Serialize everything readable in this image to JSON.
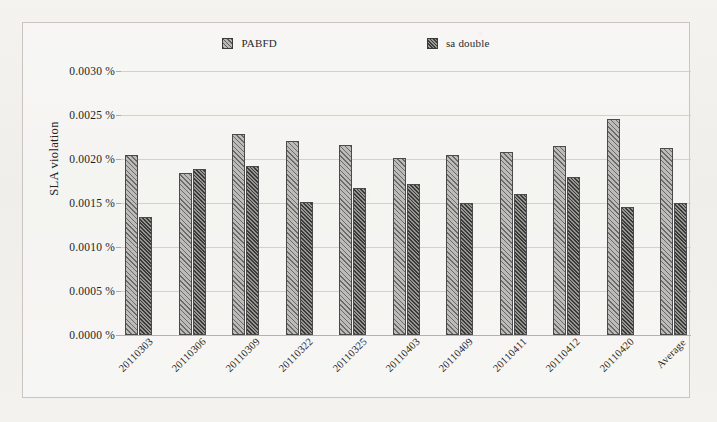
{
  "chart_data": {
    "type": "bar",
    "title": "",
    "xlabel": "",
    "ylabel": "SLA violation",
    "ylim": [
      0.0,
      0.003
    ],
    "grid": true,
    "legend_position": "top",
    "categories": [
      "20110303",
      "20110306",
      "20110309",
      "20110322",
      "20110325",
      "20110403",
      "20110409",
      "20110411",
      "20110412",
      "20110420",
      "Average"
    ],
    "ytick_labels": [
      "0.0030 %",
      "0.0025 %",
      "0.0020 %",
      "0.0015 %",
      "0.0010 %",
      "0.0005 %",
      "0.0000 %"
    ],
    "ytick_values": [
      0.003,
      0.0025,
      0.002,
      0.0015,
      0.001,
      0.0005,
      0.0
    ],
    "series": [
      {
        "name": "PABFD",
        "pattern": "diagonal-hatch-light",
        "values": [
          0.00205,
          0.00184,
          0.00228,
          0.0022,
          0.00216,
          0.00201,
          0.00205,
          0.00208,
          0.00215,
          0.00245,
          0.00213
        ]
      },
      {
        "name": "sa double",
        "pattern": "diagonal-hatch-dark",
        "values": [
          0.00134,
          0.00189,
          0.00192,
          0.00151,
          0.00167,
          0.00172,
          0.0015,
          0.0016,
          0.0018,
          0.00146,
          0.0015
        ]
      }
    ]
  },
  "legend": {
    "entries": [
      {
        "label": "PABFD",
        "swatch": "legend-swatch-pabfd"
      },
      {
        "label": "sa double",
        "swatch": "legend-swatch-sa-double"
      }
    ]
  },
  "colors": {
    "series_1_fill": "#bcbbb7",
    "series_2_fill": "#96958f",
    "bar_outline": "#4a4a4a",
    "gridline": "#d3d1cc",
    "frame_border": "#c9c6c0",
    "page_background": "#f2f1ee",
    "text": "#1e1e1e"
  }
}
